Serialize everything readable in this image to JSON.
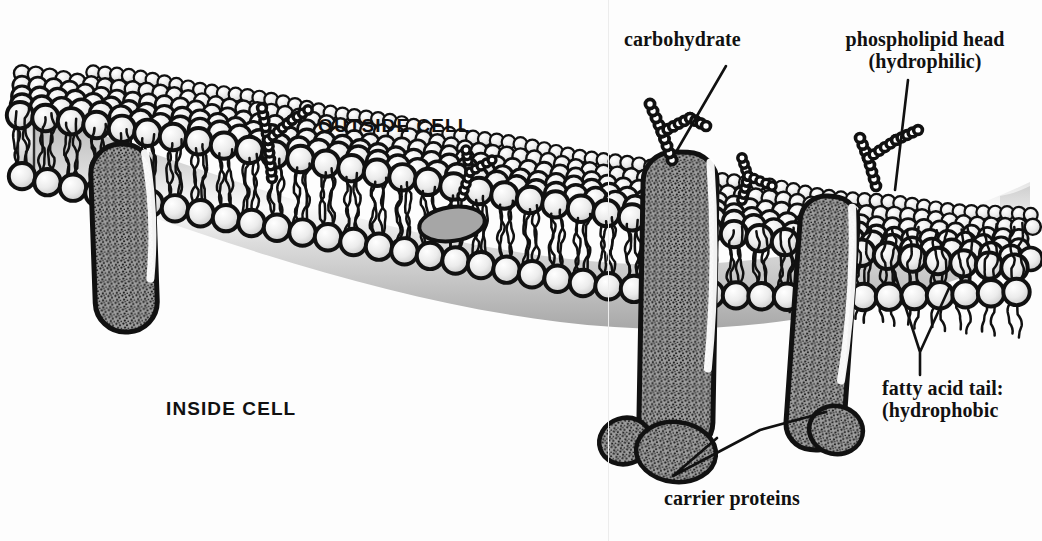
{
  "diagram": {
    "background_color": "#fdfdfd",
    "ink_color": "#111111",
    "protein_fill": "#9a9a9a",
    "head_fill": "#e8e8e8",
    "interior_fill": "#b9b9b9"
  },
  "labels": {
    "outside_cell": "OUTSIDE CELL",
    "inside_cell": "INSIDE CELL",
    "carbohydrate": "carbohydrate",
    "phospholipid_head_line1": "phospholipid head",
    "phospholipid_head_line2": "(hydrophilic)",
    "fatty_acid_line1": "fatty acid tail:",
    "fatty_acid_line2": "(hydrophobic",
    "carrier_proteins": "carrier proteins"
  },
  "structures": {
    "phospholipid_head": "sphere with two wavy tails",
    "carrier_protein": "stippled grey transmembrane capsule",
    "carbohydrate_chain": "branched chain of small beads",
    "bilayer": "two leaflets, heads outward, tails inward"
  },
  "geometry": {
    "carrier_protein_count": 4,
    "carbohydrate_chain_count": 5,
    "outer_surface_rows": 5
  }
}
